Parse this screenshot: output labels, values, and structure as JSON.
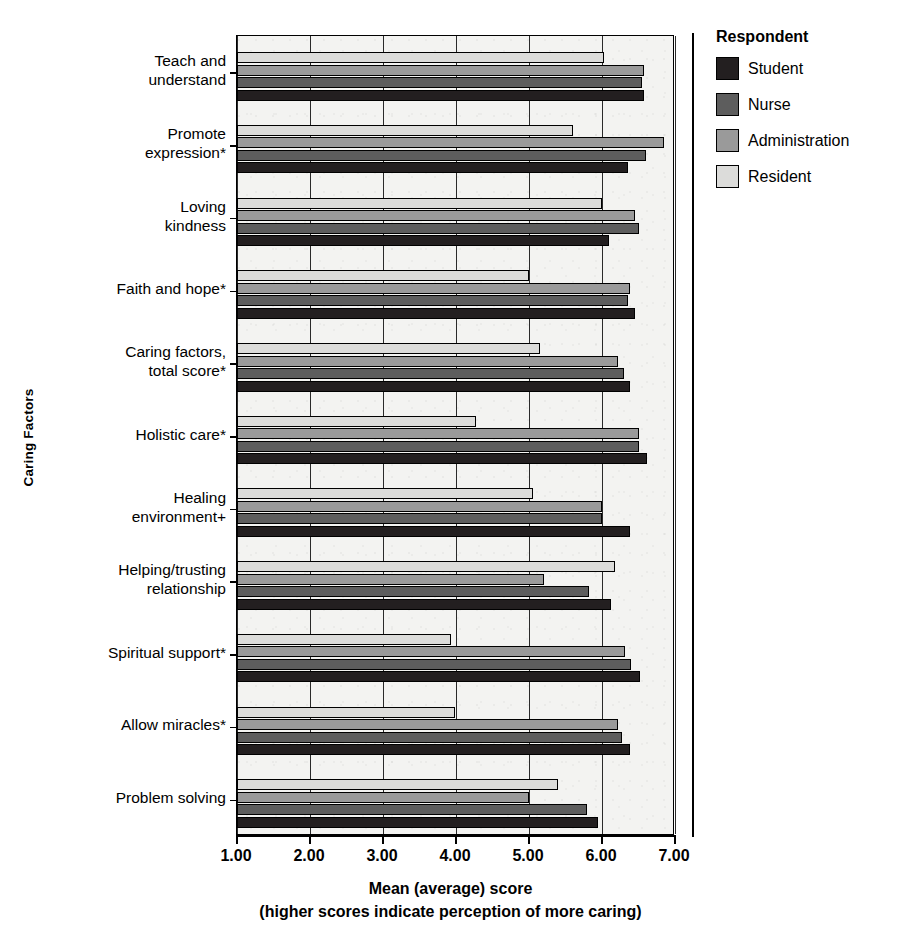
{
  "legend": {
    "title": "Respondent",
    "entries": [
      {
        "label": "Student",
        "color": "#231f20"
      },
      {
        "label": "Nurse",
        "color": "#5d5d5d"
      },
      {
        "label": "Administration",
        "color": "#9a9a9a"
      },
      {
        "label": "Resident",
        "color": "#dcdcda"
      }
    ]
  },
  "axes": {
    "y_title": "Caring Factors",
    "x_title": "Mean (average) score",
    "x_subtitle": "(higher scores indicate perception of more caring)",
    "x_ticks": [
      "1.00",
      "2.00",
      "3.00",
      "4.00",
      "5.00",
      "6.00",
      "7.00"
    ]
  },
  "chart_data": {
    "type": "bar",
    "orientation": "horizontal",
    "title": "",
    "xlabel": "Mean (average) score",
    "ylabel": "Caring Factors",
    "xlim": [
      1.0,
      7.0
    ],
    "grid": true,
    "legend_position": "right",
    "legend_title": "Respondent",
    "categories": [
      "Teach and understand",
      "Promote expression*",
      "Loving kindness",
      "Faith and hope*",
      "Caring factors, total score*",
      "Holistic care*",
      "Healing environment+",
      "Helping/trusting relationship",
      "Spiritual support*",
      "Allow miracles*",
      "Problem solving"
    ],
    "category_lines": [
      [
        "Teach and",
        "understand"
      ],
      [
        "Promote",
        "expression*"
      ],
      [
        "Loving",
        "kindness"
      ],
      [
        "Faith and hope*"
      ],
      [
        "Caring factors,",
        "total score*"
      ],
      [
        "Holistic care*"
      ],
      [
        "Healing",
        "environment+"
      ],
      [
        "Helping/trusting",
        "relationship"
      ],
      [
        "Spiritual support*"
      ],
      [
        "Allow miracles*"
      ],
      [
        "Problem solving"
      ]
    ],
    "series": [
      {
        "name": "Student",
        "color": "#231f20",
        "values": [
          6.58,
          6.35,
          6.1,
          6.45,
          6.38,
          6.62,
          6.38,
          6.12,
          6.52,
          6.38,
          5.95
        ]
      },
      {
        "name": "Nurse",
        "color": "#5d5d5d",
        "values": [
          6.55,
          6.6,
          6.5,
          6.35,
          6.3,
          6.5,
          6.0,
          5.82,
          6.4,
          6.28,
          5.8
        ]
      },
      {
        "name": "Administration",
        "color": "#9a9a9a",
        "values": [
          6.57,
          6.85,
          6.45,
          6.38,
          6.22,
          6.5,
          6.0,
          5.2,
          6.32,
          6.22,
          5.0
        ]
      },
      {
        "name": "Resident",
        "color": "#dcdcda",
        "values": [
          6.03,
          5.6,
          6.0,
          5.0,
          5.15,
          4.27,
          5.05,
          6.18,
          3.93,
          3.98,
          5.4
        ]
      }
    ]
  }
}
